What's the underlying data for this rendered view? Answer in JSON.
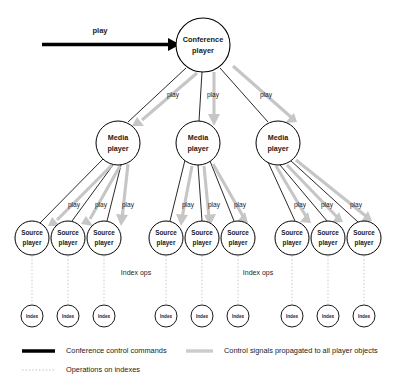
{
  "diagram": {
    "colors": {
      "black": "#000000",
      "control_signal_grey": "#c6c6c6",
      "index_ops_dotted": "#b9b9b9",
      "node_fill": "#ffffff"
    },
    "command_arrow": {
      "label": "play",
      "name": "conference-control-command-arrow"
    },
    "root": {
      "label_line1": "Conference",
      "label_line2": "player",
      "cx": 203,
      "cy": 45,
      "r": 27
    },
    "root_edge_labels": [
      {
        "label": "play",
        "x": 173,
        "y": 95
      },
      {
        "label": "play",
        "x": 213,
        "y": 95
      },
      {
        "label": "play",
        "x": 266,
        "y": 95
      }
    ],
    "media_players": [
      {
        "label_line1": "Media",
        "label_line2": "player",
        "cx": 118,
        "cy": 143,
        "r": 22
      },
      {
        "label_line1": "Media",
        "label_line2": "player",
        "cx": 198,
        "cy": 143,
        "r": 22
      },
      {
        "label_line1": "Media",
        "label_line2": "player",
        "cx": 278,
        "cy": 143,
        "r": 22
      }
    ],
    "source_players": [
      {
        "label_line1": "Source",
        "label_line2": "player",
        "cx": 32,
        "cy": 238,
        "r": 17,
        "group": 0
      },
      {
        "label_line1": "Source",
        "label_line2": "player",
        "cx": 68,
        "cy": 238,
        "r": 17,
        "group": 0
      },
      {
        "label_line1": "Source",
        "label_line2": "player",
        "cx": 104,
        "cy": 238,
        "r": 17,
        "group": 0
      },
      {
        "label_line1": "Source",
        "label_line2": "player",
        "cx": 166,
        "cy": 238,
        "r": 17,
        "group": 1
      },
      {
        "label_line1": "Source",
        "label_line2": "player",
        "cx": 202,
        "cy": 238,
        "r": 17,
        "group": 1
      },
      {
        "label_line1": "Source",
        "label_line2": "player",
        "cx": 238,
        "cy": 238,
        "r": 17,
        "group": 1
      },
      {
        "label_line1": "Source",
        "label_line2": "player",
        "cx": 292,
        "cy": 238,
        "r": 17,
        "group": 2
      },
      {
        "label_line1": "Source",
        "label_line2": "player",
        "cx": 328,
        "cy": 238,
        "r": 17,
        "group": 2
      },
      {
        "label_line1": "Source",
        "label_line2": "player",
        "cx": 364,
        "cy": 238,
        "r": 17,
        "group": 2
      }
    ],
    "source_edge_labels": [
      {
        "label": "play",
        "x": 74,
        "y": 205
      },
      {
        "label": "play",
        "x": 101,
        "y": 205
      },
      {
        "label": "play",
        "x": 128,
        "y": 205
      },
      {
        "label": "play",
        "x": 188,
        "y": 205
      },
      {
        "label": "play",
        "x": 214,
        "y": 205
      },
      {
        "label": "play",
        "x": 240,
        "y": 205
      },
      {
        "label": "play",
        "x": 300,
        "y": 205
      },
      {
        "label": "play",
        "x": 327,
        "y": 205
      },
      {
        "label": "play",
        "x": 356,
        "y": 205
      }
    ],
    "indexes": [
      {
        "label": "Index",
        "cx": 32,
        "cy": 316,
        "r": 11
      },
      {
        "label": "Index",
        "cx": 68,
        "cy": 316,
        "r": 11
      },
      {
        "label": "Index",
        "cx": 104,
        "cy": 316,
        "r": 11
      },
      {
        "label": "Index",
        "cx": 166,
        "cy": 316,
        "r": 11
      },
      {
        "label": "Index",
        "cx": 202,
        "cy": 316,
        "r": 11
      },
      {
        "label": "Index",
        "cx": 238,
        "cy": 316,
        "r": 11
      },
      {
        "label": "Index",
        "cx": 292,
        "cy": 316,
        "r": 11
      },
      {
        "label": "Index",
        "cx": 328,
        "cy": 316,
        "r": 11
      },
      {
        "label": "Index",
        "cx": 364,
        "cy": 316,
        "r": 11
      }
    ],
    "index_ops_labels": [
      {
        "label": "Index ops",
        "x": 136,
        "y": 273
      },
      {
        "label": "Index ops",
        "x": 258,
        "y": 273
      }
    ],
    "legend": [
      {
        "style": "solid-black",
        "label": "Conference control commands"
      },
      {
        "style": "dotted-grey",
        "label": "Operations on indexes"
      },
      {
        "style": "solid-grey",
        "label": "Control signals propagated to all player objects"
      }
    ]
  }
}
